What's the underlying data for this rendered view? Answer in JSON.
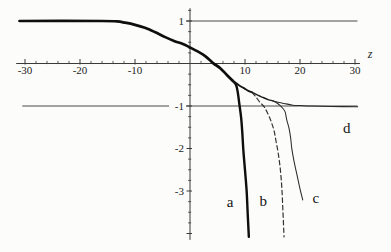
{
  "figure": {
    "background": "#fcfcfa",
    "ink": "#1a1a1a",
    "axis_color": "#3a3a3a",
    "ref_line_color": "#4a4a4a"
  },
  "chart_data": {
    "type": "line",
    "title": "",
    "xlabel": "z",
    "ylabel": "",
    "x_range": [
      -31.6,
      30.9
    ],
    "y_range": [
      -4.15,
      1.3
    ],
    "x_major_ticks": [
      -30,
      -20,
      -10,
      10,
      20,
      30
    ],
    "x_minor_step": 2,
    "y_major_ticks": [
      1,
      -1,
      -2,
      -3
    ],
    "y_minor_step": 0.25,
    "grid": false,
    "legend_position": "inline-letters",
    "ref_lines": [
      {
        "value": 1,
        "segments": [
          [
            -0.73,
            30.45
          ]
        ]
      },
      {
        "value": -1,
        "segments": [
          [
            -30.5,
            -3.8
          ],
          [
            -0.73,
            30.45
          ]
        ]
      }
    ],
    "series": [
      {
        "name": "common-abcd",
        "style": "thick",
        "points": [
          [
            -31,
            1.0
          ],
          [
            -16,
            1.0
          ],
          [
            -13.3,
            0.99
          ],
          [
            -11.8,
            0.96
          ],
          [
            -10,
            0.91
          ],
          [
            -8.2,
            0.84
          ],
          [
            -6.4,
            0.74
          ],
          [
            -4.5,
            0.62
          ],
          [
            -2.9,
            0.53
          ],
          [
            -1.3,
            0.46
          ],
          [
            -0.2,
            0.39
          ],
          [
            1.3,
            0.29
          ],
          [
            2.7,
            0.18
          ],
          [
            4.2,
            0.01
          ],
          [
            5.5,
            -0.11
          ],
          [
            6.7,
            -0.27
          ],
          [
            7.8,
            -0.41
          ]
        ]
      },
      {
        "name": "a",
        "style": "thick2",
        "points": [
          [
            7.8,
            -0.41
          ],
          [
            8.4,
            -0.51
          ],
          [
            8.7,
            -0.69
          ],
          [
            9.0,
            -0.98
          ],
          [
            9.3,
            -1.28
          ],
          [
            9.5,
            -1.61
          ],
          [
            9.7,
            -2.04
          ],
          [
            10.0,
            -2.51
          ],
          [
            10.3,
            -3.0
          ],
          [
            10.5,
            -3.56
          ],
          [
            10.7,
            -4.08
          ]
        ]
      },
      {
        "name": "common-bcd",
        "style": "medium",
        "points": [
          [
            7.8,
            -0.41
          ],
          [
            8.9,
            -0.51
          ],
          [
            9.8,
            -0.58
          ],
          [
            10.7,
            -0.65
          ],
          [
            11.3,
            -0.68
          ]
        ]
      },
      {
        "name": "b",
        "style": "dashed",
        "points": [
          [
            11.3,
            -0.68
          ],
          [
            12.0,
            -0.79
          ],
          [
            12.7,
            -0.91
          ],
          [
            13.5,
            -1.02
          ],
          [
            14.0,
            -1.14
          ],
          [
            14.5,
            -1.28
          ],
          [
            14.9,
            -1.42
          ],
          [
            15.3,
            -1.59
          ],
          [
            15.6,
            -1.8
          ],
          [
            16.0,
            -2.08
          ],
          [
            16.4,
            -2.46
          ],
          [
            16.7,
            -2.93
          ],
          [
            16.9,
            -3.49
          ],
          [
            17.1,
            -4.08
          ]
        ]
      },
      {
        "name": "common-cd",
        "style": "medium2",
        "points": [
          [
            11.3,
            -0.68
          ],
          [
            12.4,
            -0.75
          ],
          [
            13.3,
            -0.8
          ],
          [
            14.2,
            -0.85
          ],
          [
            15.1,
            -0.88
          ]
        ]
      },
      {
        "name": "c",
        "style": "thin",
        "points": [
          [
            15.1,
            -0.88
          ],
          [
            15.8,
            -0.93
          ],
          [
            16.4,
            -0.99
          ],
          [
            16.9,
            -1.06
          ],
          [
            17.3,
            -1.14
          ],
          [
            17.6,
            -1.33
          ],
          [
            18.0,
            -1.52
          ],
          [
            18.3,
            -1.75
          ],
          [
            18.5,
            -1.99
          ],
          [
            18.9,
            -2.29
          ],
          [
            19.5,
            -2.65
          ],
          [
            20.0,
            -2.95
          ],
          [
            20.5,
            -3.21
          ]
        ]
      },
      {
        "name": "d",
        "style": "thin",
        "points": [
          [
            15.1,
            -0.88
          ],
          [
            16.2,
            -0.92
          ],
          [
            17.5,
            -0.95
          ],
          [
            18.7,
            -0.98
          ],
          [
            20.2,
            -0.99
          ],
          [
            22.0,
            -1.0
          ],
          [
            25.6,
            -1.01
          ],
          [
            30.5,
            -1.02
          ]
        ]
      }
    ],
    "annotations": [
      {
        "label": "a",
        "z": 7.3,
        "v": -3.26
      },
      {
        "label": "b",
        "z": 13.3,
        "v": -3.24
      },
      {
        "label": "c",
        "z": 22.9,
        "v": -3.16
      },
      {
        "label": "d",
        "z": 28.5,
        "v": -1.52
      }
    ],
    "axis_tick_labels": {
      "x": [
        "-30",
        "-20",
        "-10",
        "10",
        "20",
        "30"
      ],
      "y": [
        "1",
        "-1",
        "-2",
        "-3"
      ]
    }
  }
}
